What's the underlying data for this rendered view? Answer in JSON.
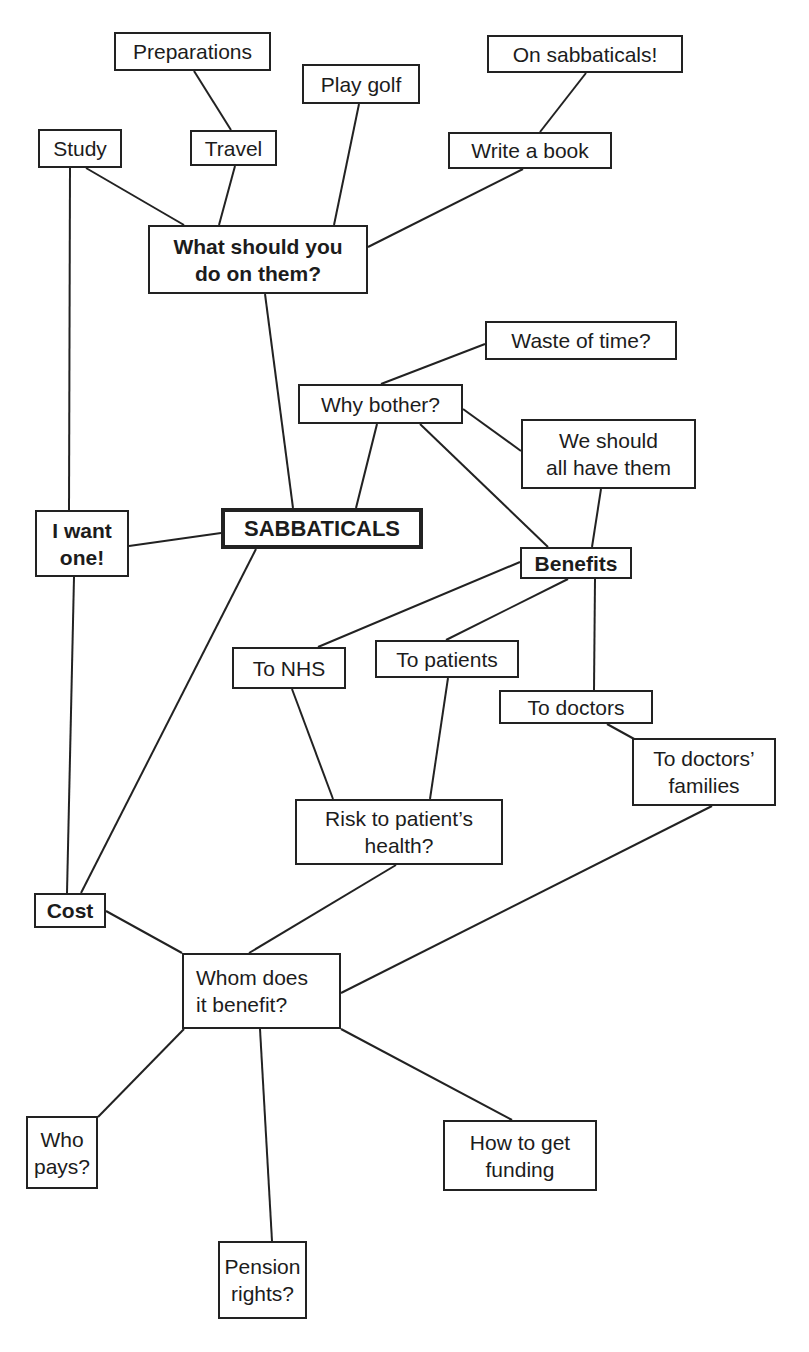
{
  "diagram": {
    "type": "mind-map",
    "central_topic": "SABBATICALS",
    "nodes": [
      {
        "id": "preparations",
        "label": "Preparations",
        "x": 114,
        "y": 32,
        "w": 157,
        "h": 39,
        "bold": false
      },
      {
        "id": "play-golf",
        "label": "Play golf",
        "x": 302,
        "y": 64,
        "w": 118,
        "h": 40,
        "bold": false
      },
      {
        "id": "on-sabbaticals",
        "label": "On sabbaticals!",
        "x": 487,
        "y": 35,
        "w": 196,
        "h": 38,
        "bold": false
      },
      {
        "id": "study",
        "label": "Study",
        "x": 38,
        "y": 129,
        "w": 84,
        "h": 39,
        "bold": false
      },
      {
        "id": "travel",
        "label": "Travel",
        "x": 190,
        "y": 130,
        "w": 87,
        "h": 36,
        "bold": false
      },
      {
        "id": "write-a-book",
        "label": "Write a book",
        "x": 448,
        "y": 132,
        "w": 164,
        "h": 37,
        "bold": false
      },
      {
        "id": "what-should-you-do",
        "label": "What should you\ndo on them?",
        "x": 148,
        "y": 225,
        "w": 220,
        "h": 69,
        "bold": true
      },
      {
        "id": "waste-of-time",
        "label": "Waste of time?",
        "x": 485,
        "y": 321,
        "w": 192,
        "h": 39,
        "bold": false
      },
      {
        "id": "why-bother",
        "label": "Why bother?",
        "x": 298,
        "y": 384,
        "w": 165,
        "h": 40,
        "bold": false
      },
      {
        "id": "we-should-all-have-them",
        "label": "We should\nall have them",
        "x": 521,
        "y": 419,
        "w": 175,
        "h": 70,
        "bold": false
      },
      {
        "id": "sabbaticals",
        "label": "SABBATICALS",
        "x": 221,
        "y": 508,
        "w": 202,
        "h": 41,
        "bold": true,
        "central": true
      },
      {
        "id": "i-want-one",
        "label": "I want\none!",
        "x": 35,
        "y": 510,
        "w": 94,
        "h": 67,
        "bold": true
      },
      {
        "id": "benefits",
        "label": "Benefits",
        "x": 520,
        "y": 547,
        "w": 112,
        "h": 32,
        "bold": true
      },
      {
        "id": "to-nhs",
        "label": "To NHS",
        "x": 232,
        "y": 647,
        "w": 114,
        "h": 42,
        "bold": false
      },
      {
        "id": "to-patients",
        "label": "To patients",
        "x": 375,
        "y": 640,
        "w": 144,
        "h": 38,
        "bold": false
      },
      {
        "id": "to-doctors",
        "label": "To doctors",
        "x": 499,
        "y": 690,
        "w": 154,
        "h": 34,
        "bold": false
      },
      {
        "id": "to-doctors-families",
        "label": "To doctors’\nfamilies",
        "x": 632,
        "y": 738,
        "w": 144,
        "h": 68,
        "bold": false
      },
      {
        "id": "risk-to-patients-health",
        "label": "Risk to patient’s\nhealth?",
        "x": 295,
        "y": 799,
        "w": 208,
        "h": 66,
        "bold": false
      },
      {
        "id": "cost",
        "label": "Cost",
        "x": 34,
        "y": 893,
        "w": 72,
        "h": 35,
        "bold": true
      },
      {
        "id": "whom-does-it-benefit",
        "label": "Whom does\nit benefit?",
        "x": 182,
        "y": 953,
        "w": 159,
        "h": 76,
        "bold": false,
        "align": "left"
      },
      {
        "id": "who-pays",
        "label": "Who\npays?",
        "x": 26,
        "y": 1116,
        "w": 72,
        "h": 73,
        "bold": false
      },
      {
        "id": "how-to-get-funding",
        "label": "How to get\nfunding",
        "x": 443,
        "y": 1120,
        "w": 154,
        "h": 71,
        "bold": false
      },
      {
        "id": "pension-rights",
        "label": "Pension\nrights?",
        "x": 218,
        "y": 1241,
        "w": 89,
        "h": 78,
        "bold": false
      }
    ],
    "edges": [
      {
        "from": "preparations",
        "to": "travel",
        "x1": 194,
        "y1": 71,
        "x2": 231,
        "y2": 130
      },
      {
        "from": "travel",
        "to": "what-should-you-do",
        "x1": 235,
        "y1": 166,
        "x2": 219,
        "y2": 225
      },
      {
        "from": "study",
        "to": "what-should-you-do",
        "x1": 86,
        "y1": 168,
        "x2": 184,
        "y2": 225
      },
      {
        "from": "play-golf",
        "to": "what-should-you-do",
        "x1": 359,
        "y1": 104,
        "x2": 334,
        "y2": 225
      },
      {
        "from": "on-sabbaticals",
        "to": "write-a-book",
        "x1": 586,
        "y1": 73,
        "x2": 540,
        "y2": 132
      },
      {
        "from": "write-a-book",
        "to": "what-should-you-do",
        "x1": 523,
        "y1": 169,
        "x2": 368,
        "y2": 247
      },
      {
        "from": "what-should-you-do",
        "to": "sabbaticals",
        "x1": 265,
        "y1": 294,
        "x2": 293,
        "y2": 508
      },
      {
        "from": "study",
        "to": "i-want-one",
        "x1": 70,
        "y1": 168,
        "x2": 69,
        "y2": 510
      },
      {
        "from": "why-bother",
        "to": "sabbaticals",
        "x1": 377,
        "y1": 424,
        "x2": 356,
        "y2": 508
      },
      {
        "from": "why-bother",
        "to": "waste-of-time",
        "x1": 381,
        "y1": 384,
        "x2": 485,
        "y2": 344
      },
      {
        "from": "why-bother",
        "to": "we-should-all-have-them",
        "x1": 463,
        "y1": 409,
        "x2": 521,
        "y2": 451
      },
      {
        "from": "why-bother",
        "to": "benefits",
        "x1": 420,
        "y1": 424,
        "x2": 548,
        "y2": 547
      },
      {
        "from": "we-should-all-have-them",
        "to": "benefits",
        "x1": 601,
        "y1": 489,
        "x2": 592,
        "y2": 547
      },
      {
        "from": "i-want-one",
        "to": "sabbaticals",
        "x1": 129,
        "y1": 546,
        "x2": 221,
        "y2": 533
      },
      {
        "from": "i-want-one",
        "to": "cost",
        "x1": 74,
        "y1": 577,
        "x2": 67,
        "y2": 893
      },
      {
        "from": "sabbaticals",
        "to": "cost",
        "x1": 256,
        "y1": 549,
        "x2": 81,
        "y2": 893
      },
      {
        "from": "benefits",
        "to": "to-nhs",
        "x1": 520,
        "y1": 562,
        "x2": 318,
        "y2": 647
      },
      {
        "from": "benefits",
        "to": "to-patients",
        "x1": 568,
        "y1": 579,
        "x2": 446,
        "y2": 640
      },
      {
        "from": "benefits",
        "to": "to-doctors",
        "x1": 595,
        "y1": 579,
        "x2": 594,
        "y2": 690
      },
      {
        "from": "to-doctors",
        "to": "to-doctors-families",
        "x1": 607,
        "y1": 724,
        "x2": 636,
        "y2": 740
      },
      {
        "from": "to-nhs",
        "to": "risk-to-patients-health",
        "x1": 292,
        "y1": 689,
        "x2": 333,
        "y2": 799
      },
      {
        "from": "to-patients",
        "to": "risk-to-patients-health",
        "x1": 448,
        "y1": 678,
        "x2": 430,
        "y2": 799
      },
      {
        "from": "cost",
        "to": "whom-does-it-benefit",
        "x1": 106,
        "y1": 911,
        "x2": 182,
        "y2": 953
      },
      {
        "from": "risk-to-patients-health",
        "to": "whom-does-it-benefit",
        "x1": 396,
        "y1": 865,
        "x2": 249,
        "y2": 953
      },
      {
        "from": "to-doctors-families",
        "to": "whom-does-it-benefit",
        "x1": 712,
        "y1": 806,
        "x2": 341,
        "y2": 993
      },
      {
        "from": "whom-does-it-benefit",
        "to": "who-pays",
        "x1": 184,
        "y1": 1029,
        "x2": 98,
        "y2": 1117
      },
      {
        "from": "whom-does-it-benefit",
        "to": "pension-rights",
        "x1": 260,
        "y1": 1029,
        "x2": 272,
        "y2": 1241
      },
      {
        "from": "whom-does-it-benefit",
        "to": "how-to-get-funding",
        "x1": 341,
        "y1": 1029,
        "x2": 512,
        "y2": 1120
      }
    ]
  }
}
